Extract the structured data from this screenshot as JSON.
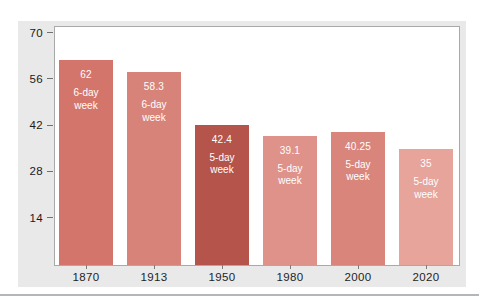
{
  "chart_data": {
    "type": "bar",
    "title": "",
    "xlabel": "",
    "ylabel": "",
    "categories": [
      "1870",
      "1913",
      "1950",
      "1980",
      "2000",
      "2020"
    ],
    "values": [
      62,
      58.3,
      42.4,
      39.1,
      40.25,
      35
    ],
    "value_labels": [
      "62",
      "58.3",
      "42.4",
      "39.1",
      "40.25",
      "35"
    ],
    "week_types": [
      "6-day",
      "6-day",
      "5-day",
      "5-day",
      "5-day",
      "5-day"
    ],
    "week_word": "week",
    "yticks": [
      70,
      56,
      42,
      28,
      14
    ],
    "ytick_labels": [
      "70",
      "56",
      "42",
      "28",
      "14"
    ],
    "ylim": [
      0,
      70
    ],
    "grid": "off",
    "legend": "none",
    "bar_colors": [
      "#d4756b",
      "#d8837a",
      "#b5544a",
      "#df928a",
      "#d9857c",
      "#e6a49b"
    ],
    "bar_text_color": "#ffffff"
  },
  "colors": {
    "panel_background": "#e9e9e9",
    "plot_background": "#ffffff",
    "plot_border": "#a9a9a9",
    "axis_text": "#1a1a1a",
    "divider": "#b4b7b9"
  }
}
